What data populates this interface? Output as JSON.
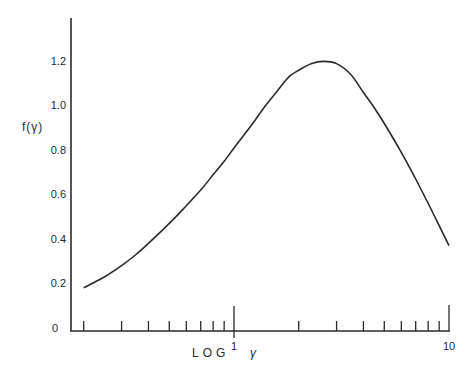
{
  "chart_data": {
    "type": "line",
    "title": "",
    "xlabel": "LOG γ",
    "ylabel": "f(γ)",
    "xscale": "log",
    "xlim": [
      0.16,
      10
    ],
    "ylim": [
      0,
      1.35
    ],
    "grid": false,
    "legend": null,
    "x_tick_labels": [
      {
        "value": 1,
        "label": "1"
      },
      {
        "value": 10,
        "label": "10"
      }
    ],
    "x_minor_ticks": [
      0.2,
      0.3,
      0.4,
      0.5,
      0.6,
      0.7,
      0.8,
      0.9,
      2,
      3,
      4,
      5,
      6,
      7,
      8,
      9
    ],
    "y_tick_labels": [
      {
        "value": 0,
        "label": "0"
      },
      {
        "value": 0.2,
        "label": "0.2"
      },
      {
        "value": 0.4,
        "label": "0.4"
      },
      {
        "value": 0.6,
        "label": "0.6"
      },
      {
        "value": 0.8,
        "label": "0.8"
      },
      {
        "value": 1.0,
        "label": "1.0"
      },
      {
        "value": 1.2,
        "label": "1.2"
      }
    ],
    "series": [
      {
        "name": "f(γ)",
        "x": [
          0.2,
          0.25,
          0.3,
          0.35,
          0.4,
          0.5,
          0.6,
          0.7,
          0.8,
          0.9,
          1.0,
          1.2,
          1.4,
          1.6,
          1.8,
          2.0,
          2.3,
          2.6,
          3.0,
          3.5,
          4.0,
          4.5,
          5.0,
          6.0,
          7.0,
          8.0,
          9.0,
          10.0
        ],
        "y": [
          0.19,
          0.24,
          0.29,
          0.34,
          0.39,
          0.48,
          0.56,
          0.63,
          0.7,
          0.76,
          0.82,
          0.92,
          1.01,
          1.08,
          1.14,
          1.17,
          1.2,
          1.21,
          1.2,
          1.15,
          1.07,
          1.0,
          0.93,
          0.8,
          0.68,
          0.57,
          0.47,
          0.38
        ]
      }
    ]
  },
  "labels": {
    "ylabel": "f(γ)",
    "xlabel_log": "LOG",
    "xlabel_gamma": "γ",
    "x_one": "1",
    "x_ten": "10",
    "y0": "0",
    "y02": "0.2",
    "y04": "0.4",
    "y06": "0.6",
    "y08": "0.8",
    "y10": "1.0",
    "y12": "1.2"
  }
}
